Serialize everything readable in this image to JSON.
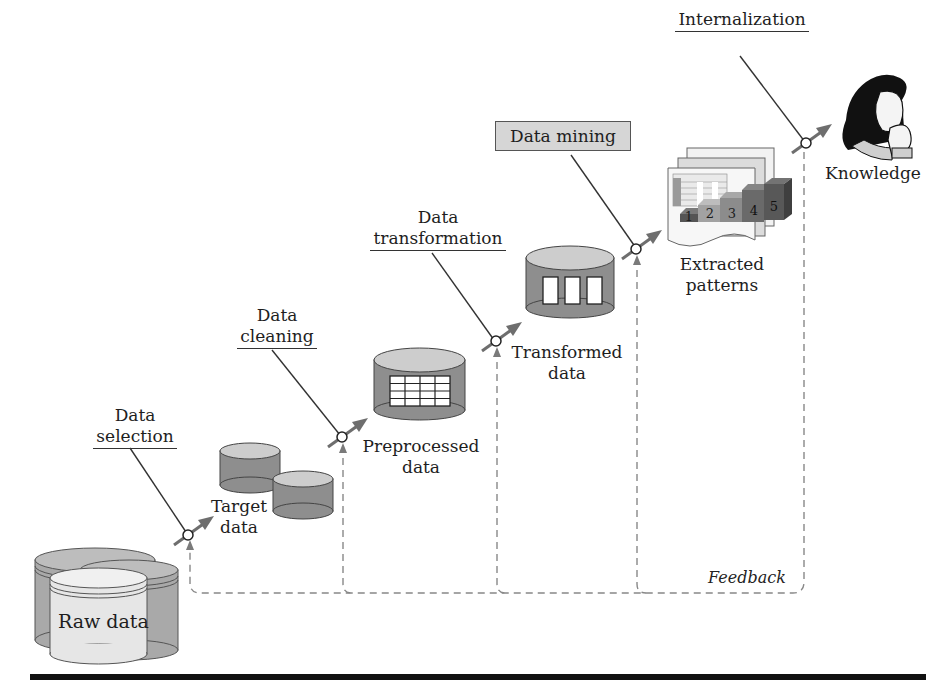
{
  "diagram": {
    "steps": [
      {
        "id": "data-selection",
        "line1": "Data",
        "line2": "selection"
      },
      {
        "id": "data-cleaning",
        "line1": "Data",
        "line2": "cleaning"
      },
      {
        "id": "data-transformation",
        "line1": "Data",
        "line2": "transformation"
      },
      {
        "id": "data-mining",
        "label": "Data mining",
        "highlighted": true
      },
      {
        "id": "internalization",
        "label": "Internalization"
      }
    ],
    "stages": [
      {
        "id": "raw-data",
        "label": "Raw data"
      },
      {
        "id": "target-data",
        "line1": "Target",
        "line2": "data"
      },
      {
        "id": "preprocessed-data",
        "line1": "Preprocessed",
        "line2": "data"
      },
      {
        "id": "transformed-data",
        "line1": "Transformed",
        "line2": "data"
      },
      {
        "id": "extracted-patterns",
        "line1": "Extracted",
        "line2": "patterns"
      },
      {
        "id": "knowledge",
        "label": "Knowledge"
      }
    ],
    "pattern_bars": [
      "1",
      "2",
      "3",
      "4",
      "5"
    ],
    "feedback_label": "Feedback",
    "colors": {
      "cylinder_body": "#8a8a8a",
      "cylinder_top": "#cfcfcf",
      "raw_front": "#e8e8e8",
      "arrow": "#6e6e6e",
      "dashed": "#888888",
      "box_fill": "#d6d6d6"
    }
  }
}
